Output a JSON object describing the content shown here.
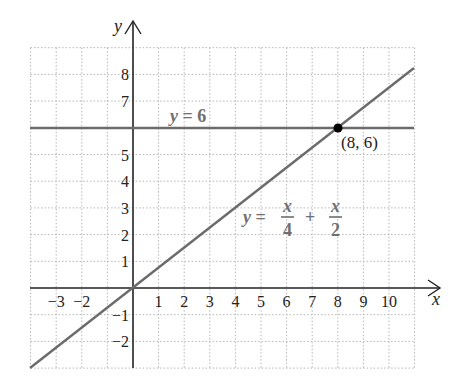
{
  "chart_data": {
    "type": "line",
    "title": "",
    "xlabel": "x",
    "ylabel": "y",
    "xlim": [
      -4,
      11
    ],
    "ylim": [
      -3,
      9
    ],
    "grid": true,
    "grid_style": "dotted",
    "x_ticks": [
      "-3",
      "-2",
      "1",
      "2",
      "3",
      "4",
      "5",
      "6",
      "7",
      "8",
      "9",
      "10"
    ],
    "y_ticks": [
      "8",
      "7",
      "5",
      "4",
      "3",
      "2",
      "1",
      "-1",
      "-2"
    ],
    "series": [
      {
        "name": "y = 6",
        "equation": "y = 6",
        "label": "y = 6",
        "color": "#6b6b6b",
        "x": [
          -4,
          11
        ],
        "y": [
          6,
          6
        ]
      },
      {
        "name": "y = x/4 + x/2",
        "equation": "y = x/4 + x/2",
        "label": {
          "lhs": "y =",
          "frac1_num": "x",
          "frac1_den": "4",
          "plus": "+",
          "frac2_num": "x",
          "frac2_den": "2"
        },
        "color": "#6b6b6b",
        "x": [
          -4,
          0,
          8,
          11
        ],
        "y": [
          -3,
          0,
          6,
          8.25
        ]
      }
    ],
    "annotations": [
      {
        "type": "point",
        "x": 8,
        "y": 6,
        "label": "(8, 6)",
        "color": "#000000"
      }
    ]
  },
  "labels": {
    "x_axis": "x",
    "y_axis": "y",
    "hline": {
      "var": "y",
      "rest": " = 6"
    },
    "point": "(8, 6)",
    "eq": {
      "var": "y",
      "eq": " =",
      "n1": "x",
      "d1": "4",
      "plus": "+",
      "n2": "x",
      "d2": "2"
    }
  },
  "colors": {
    "axis": "#222222",
    "grid": "#b5b5b5",
    "line": "#6b6b6b",
    "label": "#6f6f6f",
    "point": "#000000"
  }
}
